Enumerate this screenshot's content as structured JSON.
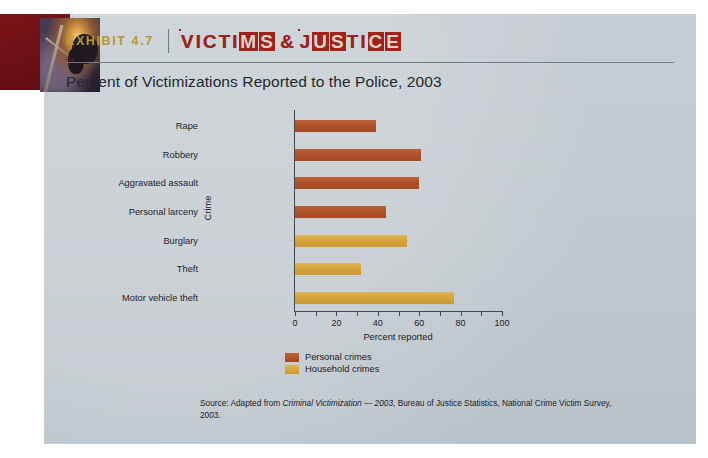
{
  "exhibit": {
    "label": "EXHIBIT 4.7",
    "banner_title": "VICTIMS & JUSTICE",
    "subtitle": "Percent of Victimizations Reported to the Police, 2003"
  },
  "legend": {
    "items": [
      {
        "label": "Personal crimes",
        "color": "#b0522a"
      },
      {
        "label": "Household crimes",
        "color": "#d6a53a"
      }
    ]
  },
  "source": {
    "prefix": "Source: Adapted from ",
    "italic": "Criminal Victimization — 2003",
    "suffix": ", Bureau of Justice Statistics, National Crime Victim Survey, 2003."
  },
  "chart_data": {
    "type": "bar",
    "orientation": "horizontal",
    "title": "Percent of Victimizations Reported to the Police, 2003",
    "xlabel": "Percent reported",
    "ylabel": "Crime",
    "xlim": [
      0,
      100
    ],
    "xticks": [
      0,
      20,
      40,
      60,
      80,
      100
    ],
    "xtick_labels": [
      "0",
      "20",
      "40",
      "60",
      "80",
      "100"
    ],
    "minor_ticks": [
      10,
      30,
      50,
      70,
      90
    ],
    "grid": false,
    "legend_position": "below-center",
    "categories": [
      "Rape",
      "Robbery",
      "Aggravated assault",
      "Personal larceny",
      "Burglary",
      "Theft",
      "Motor vehicle theft"
    ],
    "series": [
      {
        "name": "Personal crimes",
        "color": "#b0522a",
        "points": [
          {
            "category": "Rape",
            "value": 39
          },
          {
            "category": "Robbery",
            "value": 61
          },
          {
            "category": "Aggravated assault",
            "value": 60
          },
          {
            "category": "Personal larceny",
            "value": 44
          }
        ]
      },
      {
        "name": "Household crimes",
        "color": "#d6a53a",
        "points": [
          {
            "category": "Burglary",
            "value": 54
          },
          {
            "category": "Theft",
            "value": 32
          },
          {
            "category": "Motor vehicle theft",
            "value": 77
          }
        ]
      }
    ],
    "values": [
      39,
      61,
      60,
      44,
      54,
      32,
      77
    ],
    "value_colors": [
      "#b0522a",
      "#b0522a",
      "#b0522a",
      "#b0522a",
      "#d6a53a",
      "#d6a53a",
      "#d6a53a"
    ]
  }
}
